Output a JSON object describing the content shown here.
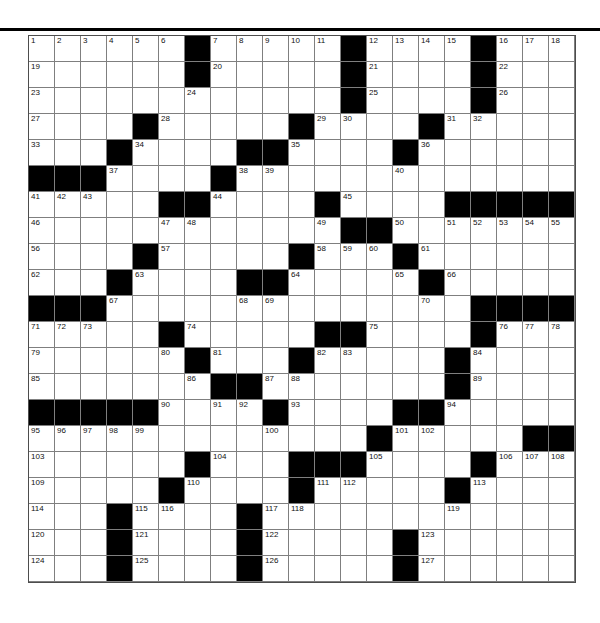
{
  "page": {
    "background_color": "#ffffff",
    "divider_color": "#000000"
  },
  "crossword": {
    "rows": 21,
    "cols": 21,
    "cell_size": 26,
    "grid_left": 28,
    "grid_top": 35,
    "line_color": "#7f7f7f",
    "outer_border_color": "#4d4d4d",
    "black_color": "#000000",
    "white_color": "#ffffff",
    "number_color": "#111111",
    "first_number": 1,
    "last_number": 127,
    "black_rows": [
      [
        7,
        13,
        18
      ],
      [
        7,
        13,
        18
      ],
      [
        13,
        18
      ],
      [
        5,
        11,
        16
      ],
      [
        4,
        9,
        10,
        15
      ],
      [
        1,
        2,
        3,
        8
      ],
      [
        6,
        7,
        12,
        17,
        18,
        19,
        20,
        21
      ],
      [
        13,
        14
      ],
      [
        5,
        11,
        15
      ],
      [
        4,
        9,
        10,
        16
      ],
      [
        1,
        2,
        3,
        18,
        19,
        20,
        21
      ],
      [
        6,
        12,
        13,
        18
      ],
      [
        7,
        11,
        17
      ],
      [
        8,
        9,
        17
      ],
      [
        1,
        2,
        3,
        4,
        5,
        10,
        15,
        16
      ],
      [
        14,
        20,
        21
      ],
      [
        7,
        11,
        12,
        13,
        18
      ],
      [
        6,
        11,
        17
      ],
      [
        4,
        9
      ],
      [
        4,
        9,
        15
      ],
      [
        4,
        9,
        15
      ]
    ],
    "number_rows": [
      [
        [
          1,
          1
        ],
        [
          2,
          2
        ],
        [
          3,
          3
        ],
        [
          4,
          4
        ],
        [
          5,
          5
        ],
        [
          6,
          6
        ],
        [
          7,
          8
        ],
        [
          8,
          9
        ],
        [
          9,
          10
        ],
        [
          10,
          11
        ],
        [
          11,
          12
        ],
        [
          12,
          14
        ],
        [
          13,
          15
        ],
        [
          14,
          16
        ],
        [
          15,
          17
        ],
        [
          16,
          19
        ],
        [
          17,
          20
        ],
        [
          18,
          21
        ]
      ],
      [
        [
          19,
          1
        ],
        [
          20,
          8
        ],
        [
          21,
          14
        ],
        [
          22,
          19
        ]
      ],
      [
        [
          23,
          1
        ],
        [
          24,
          7
        ],
        [
          25,
          14
        ],
        [
          26,
          19
        ]
      ],
      [
        [
          27,
          1
        ],
        [
          28,
          6
        ],
        [
          29,
          12
        ],
        [
          30,
          13
        ],
        [
          31,
          17
        ],
        [
          32,
          18
        ]
      ],
      [
        [
          33,
          1
        ],
        [
          34,
          5
        ],
        [
          35,
          11
        ],
        [
          36,
          16
        ]
      ],
      [
        [
          37,
          4
        ],
        [
          38,
          9
        ],
        [
          39,
          10
        ],
        [
          40,
          15
        ]
      ],
      [
        [
          41,
          1
        ],
        [
          42,
          2
        ],
        [
          43,
          3
        ],
        [
          44,
          8
        ],
        [
          45,
          13
        ]
      ],
      [
        [
          46,
          1
        ],
        [
          47,
          6
        ],
        [
          48,
          7
        ],
        [
          49,
          12
        ],
        [
          50,
          15
        ],
        [
          51,
          17
        ],
        [
          52,
          18
        ],
        [
          53,
          19
        ],
        [
          54,
          20
        ],
        [
          55,
          21
        ]
      ],
      [
        [
          56,
          1
        ],
        [
          57,
          6
        ],
        [
          58,
          12
        ],
        [
          59,
          13
        ],
        [
          60,
          14
        ],
        [
          61,
          16
        ]
      ],
      [
        [
          62,
          1
        ],
        [
          63,
          5
        ],
        [
          64,
          11
        ],
        [
          65,
          15
        ],
        [
          66,
          17
        ]
      ],
      [
        [
          67,
          4
        ],
        [
          68,
          9
        ],
        [
          69,
          10
        ],
        [
          70,
          16
        ]
      ],
      [
        [
          71,
          1
        ],
        [
          72,
          2
        ],
        [
          73,
          3
        ],
        [
          74,
          7
        ],
        [
          75,
          14
        ],
        [
          76,
          19
        ],
        [
          77,
          20
        ],
        [
          78,
          21
        ]
      ],
      [
        [
          79,
          1
        ],
        [
          80,
          6
        ],
        [
          81,
          8
        ],
        [
          82,
          12
        ],
        [
          83,
          13
        ],
        [
          84,
          18
        ]
      ],
      [
        [
          85,
          1
        ],
        [
          86,
          7
        ],
        [
          87,
          10
        ],
        [
          88,
          11
        ],
        [
          89,
          18
        ]
      ],
      [
        [
          90,
          6
        ],
        [
          91,
          8
        ],
        [
          92,
          9
        ],
        [
          93,
          11
        ],
        [
          94,
          17
        ]
      ],
      [
        [
          95,
          1
        ],
        [
          96,
          2
        ],
        [
          97,
          3
        ],
        [
          98,
          4
        ],
        [
          99,
          5
        ],
        [
          100,
          10
        ],
        [
          101,
          15
        ],
        [
          102,
          16
        ]
      ],
      [
        [
          103,
          1
        ],
        [
          104,
          8
        ],
        [
          105,
          14
        ],
        [
          106,
          19
        ],
        [
          107,
          20
        ],
        [
          108,
          21
        ]
      ],
      [
        [
          109,
          1
        ],
        [
          110,
          7
        ],
        [
          111,
          12
        ],
        [
          112,
          13
        ],
        [
          113,
          18
        ]
      ],
      [
        [
          114,
          1
        ],
        [
          115,
          5
        ],
        [
          116,
          6
        ],
        [
          117,
          10
        ],
        [
          118,
          11
        ],
        [
          119,
          17
        ]
      ],
      [
        [
          120,
          1
        ],
        [
          121,
          5
        ],
        [
          122,
          10
        ],
        [
          123,
          16
        ]
      ],
      [
        [
          124,
          1
        ],
        [
          125,
          5
        ],
        [
          126,
          10
        ],
        [
          127,
          16
        ]
      ]
    ]
  }
}
